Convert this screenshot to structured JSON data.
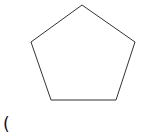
{
  "diagram": {
    "shape": "pentagon",
    "stroke_color": "#333333",
    "fill_color": "#ffffff",
    "stroke_width": 1,
    "points": "82,5 135,42 116,100 51,100 31,42"
  },
  "label": {
    "text": "("
  }
}
